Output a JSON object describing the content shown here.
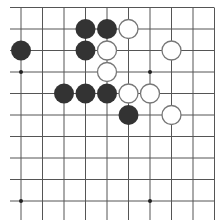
{
  "game": {
    "type": "go-board-diagram",
    "visible_columns": 10,
    "visible_rows": 10,
    "top_edge_visible": true,
    "colors": {
      "background": "#ffffff",
      "grid_line": "#555555",
      "black_stone": "#333333",
      "white_stone_fill": "#ffffff",
      "white_stone_border": "#777777",
      "star_point": "#222222"
    },
    "star_points": [
      {
        "col": 0,
        "row": 3
      },
      {
        "col": 6,
        "row": 3
      },
      {
        "col": 0,
        "row": 9
      },
      {
        "col": 6,
        "row": 9
      }
    ],
    "stones": [
      {
        "color": "black",
        "col": 3,
        "row": 1
      },
      {
        "color": "black",
        "col": 4,
        "row": 1
      },
      {
        "color": "white",
        "col": 5,
        "row": 1
      },
      {
        "color": "black",
        "col": 0,
        "row": 2
      },
      {
        "color": "black",
        "col": 3,
        "row": 2
      },
      {
        "color": "white",
        "col": 4,
        "row": 2
      },
      {
        "color": "white",
        "col": 7,
        "row": 2
      },
      {
        "color": "white",
        "col": 4,
        "row": 3
      },
      {
        "color": "black",
        "col": 2,
        "row": 4
      },
      {
        "color": "black",
        "col": 3,
        "row": 4
      },
      {
        "color": "black",
        "col": 4,
        "row": 4
      },
      {
        "color": "white",
        "col": 5,
        "row": 4
      },
      {
        "color": "white",
        "col": 6,
        "row": 4
      },
      {
        "color": "black",
        "col": 5,
        "row": 5
      },
      {
        "color": "white",
        "col": 7,
        "row": 5
      }
    ]
  }
}
